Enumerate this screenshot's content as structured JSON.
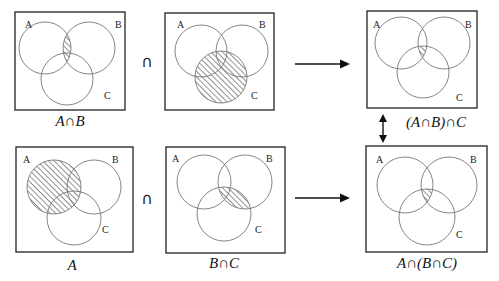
{
  "diagram": {
    "operator_symbol": "∩",
    "panels": [
      {
        "id": "a-cap-b",
        "caption": "A∩B",
        "labels": {
          "a": "A",
          "b": "B",
          "c": "C"
        },
        "shaded": "A∩B"
      },
      {
        "id": "c",
        "caption": "",
        "labels": {
          "a": "A",
          "b": "B",
          "c": "C"
        },
        "shaded": "C"
      },
      {
        "id": "a-cap-b-cap-c",
        "caption": "(A∩B)∩C",
        "labels": {
          "a": "A",
          "b": "B",
          "c": "C"
        },
        "shaded": "A∩B∩C"
      },
      {
        "id": "a",
        "caption": "A",
        "labels": {
          "a": "A",
          "b": "B",
          "c": "C"
        },
        "shaded": "A"
      },
      {
        "id": "b-cap-c",
        "caption": "B∩C",
        "labels": {
          "a": "A",
          "b": "B",
          "c": "C"
        },
        "shaded": "B∩C"
      },
      {
        "id": "a-cap-b-cap-c-2",
        "caption": "A∩(B∩C)",
        "labels": {
          "a": "A",
          "b": "B",
          "c": "C"
        },
        "shaded": "A∩B∩C"
      }
    ],
    "arrows": [
      {
        "from": "top-row",
        "to": "(A∩B)∩C",
        "type": "right"
      },
      {
        "from": "bottom-row",
        "to": "A∩(B∩C)",
        "type": "right"
      },
      {
        "between": [
          "(A∩B)∩C",
          "A∩(B∩C)"
        ],
        "type": "double-vertical"
      }
    ]
  }
}
